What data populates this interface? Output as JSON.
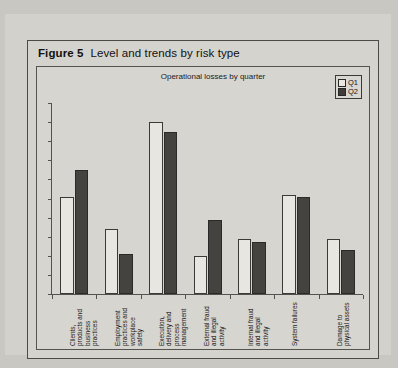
{
  "figure": {
    "number_label": "Figure 5",
    "title": "Level and trends by risk type"
  },
  "chart_data": {
    "type": "bar",
    "title": "Operational losses by quarter",
    "subtitle": "Operational losses by quarter",
    "xlabel": "",
    "ylabel": "",
    "ylim": [
      0,
      100
    ],
    "grid": false,
    "legend_position": "top-right",
    "categories": [
      "Clients, products and business practices",
      "Employment practices and workplace safety",
      "Execution, delivery and process management",
      "External fraud and illegal activity",
      "Internal fraud and illegal activity",
      "System failures",
      "Damage to physical assets"
    ],
    "series": [
      {
        "name": "Q1",
        "color": "#e8e6e1",
        "values": [
          51,
          34,
          90,
          20,
          29,
          52,
          29
        ]
      },
      {
        "name": "Q2",
        "color": "#454340",
        "values": [
          65,
          21,
          85,
          39,
          27,
          51,
          23
        ]
      }
    ]
  },
  "legend": {
    "items": [
      {
        "label": "Q1"
      },
      {
        "label": "Q2"
      }
    ]
  }
}
